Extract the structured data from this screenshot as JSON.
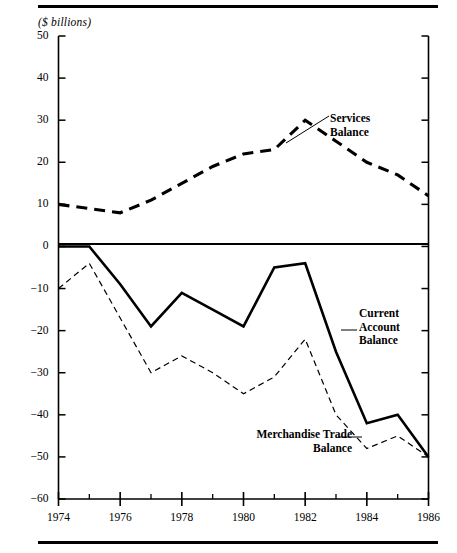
{
  "figure": {
    "unit_label": "($ billions)",
    "rule_color": "#000000"
  },
  "chart_data": {
    "type": "line",
    "title": "",
    "subtitle": "",
    "xlabel": "",
    "ylabel": "($ billions)",
    "xlim": [
      1974,
      1986
    ],
    "ylim": [
      -60,
      50
    ],
    "grid": false,
    "legend_position": "inline-annotations",
    "x": [
      1974,
      1975,
      1976,
      1977,
      1978,
      1979,
      1980,
      1981,
      1982,
      1983,
      1984,
      1985,
      1986
    ],
    "xticks": [
      1974,
      1976,
      1978,
      1980,
      1982,
      1984,
      1986
    ],
    "xtick_labels": [
      "1974",
      "1976",
      "1978",
      "1980",
      "1982",
      "1984",
      "1986"
    ],
    "xminor_ticks": [
      1975,
      1977,
      1979,
      1981,
      1983,
      1985
    ],
    "yticks": [
      50,
      40,
      30,
      20,
      10,
      0,
      -10,
      -20,
      -30,
      -40,
      -50,
      -60
    ],
    "ytick_labels": [
      "50",
      "40",
      "30",
      "20",
      "10",
      "0",
      "−10",
      "−20",
      "−30",
      "−40",
      "−50",
      "−60"
    ],
    "series": [
      {
        "name": "Services Balance",
        "label": "Services\nBalance",
        "style": "thick-dashed",
        "color": "#000000",
        "values": [
          10,
          9,
          8,
          11,
          15,
          19,
          22,
          23,
          30,
          25,
          20,
          17,
          12
        ]
      },
      {
        "name": "Current Account Balance",
        "label": "Current\nAccount\nBalance",
        "style": "thick-solid",
        "color": "#000000",
        "values": [
          0,
          0,
          -9,
          -19,
          -11,
          -15,
          -19,
          -5,
          -4,
          -25,
          -42,
          -40,
          -50
        ]
      },
      {
        "name": "Merchandise Trade Balance",
        "label": "Merchandise Trade\nBalance",
        "style": "thin-dashed",
        "color": "#000000",
        "values": [
          -10,
          -4,
          -17,
          -30,
          -26,
          -30,
          -35,
          -31,
          -22,
          -40,
          -48,
          -45,
          -50
        ]
      }
    ],
    "annotations": [
      {
        "text": "Services Balance",
        "anchor_x": 1982,
        "anchor_y": 25
      },
      {
        "text": "Current Account Balance",
        "anchor_x": 1983.2,
        "anchor_y": -25
      },
      {
        "text": "Merchandise Trade Balance",
        "anchor_x": 1983.6,
        "anchor_y": -45
      }
    ]
  }
}
